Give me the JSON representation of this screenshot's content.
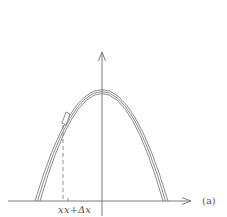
{
  "figure": {
    "panel_label": "(a)",
    "x_label_left": "x",
    "x_label_right": "x+Δx",
    "colors": {
      "stroke": "#6e6e6e",
      "text": "#555555",
      "background": "#ffffff"
    },
    "axes": {
      "x_axis": "horizontal-arrow",
      "y_axis": "vertical-arrow"
    },
    "curve": {
      "shape": "downward-parabola",
      "strands": 3,
      "segment_highlight": "small-rectangle-element"
    },
    "marker": "dashed-vertical-line-at-x"
  }
}
